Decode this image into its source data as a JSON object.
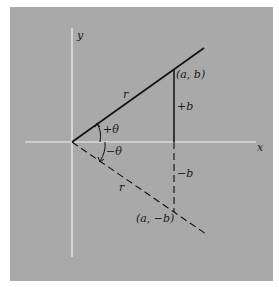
{
  "diagram": {
    "colors": {
      "page_background": "#ffffff",
      "panel_background": "#a9a9a9",
      "axis": "#f2f2f2",
      "line": "#111111"
    },
    "axes": {
      "x_label": "x",
      "y_label": "y"
    },
    "vectors": {
      "upper": {
        "length_label": "r",
        "angle_label": "+θ",
        "point_label": "(a, b)",
        "side_label": "+b",
        "style": "solid"
      },
      "lower": {
        "length_label": "r",
        "angle_label": "−θ",
        "point_label": "(a, −b)",
        "side_label": "−b",
        "style": "dashed"
      }
    }
  }
}
